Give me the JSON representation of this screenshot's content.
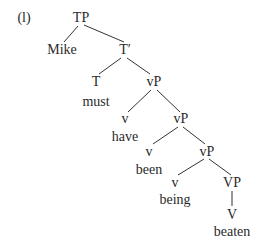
{
  "example_label": "(l)",
  "nodes": {
    "tp": "TP",
    "mike": "Mike",
    "t_bar": "T′",
    "t": "T",
    "must": "must",
    "vp1": "vP",
    "v1": "v",
    "have": "have",
    "vp2": "vP",
    "v2": "v",
    "been": "been",
    "vp3": "vP",
    "v3": "v",
    "being": "being",
    "big_vp": "VP",
    "big_v": "V",
    "beaten": "beaten"
  },
  "style": {
    "line_color": "#333333",
    "text_color": "#2a2a2a"
  }
}
